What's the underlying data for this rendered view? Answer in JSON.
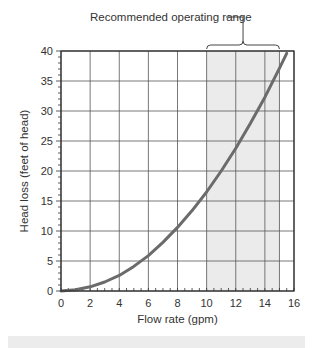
{
  "chart_data": {
    "type": "line",
    "title": "",
    "annotation": "Recommended operating range",
    "xlabel": "Flow rate (gpm)",
    "ylabel": "Head loss (feet of head)",
    "xlim": [
      0,
      16
    ],
    "ylim": [
      0,
      40
    ],
    "xticks": [
      0,
      2,
      4,
      6,
      8,
      10,
      12,
      14,
      16
    ],
    "yticks": [
      0,
      5,
      10,
      15,
      20,
      25,
      30,
      35,
      40
    ],
    "grid": true,
    "shaded_range": {
      "x_start": 10,
      "x_end": 15,
      "label": "Recommended operating range"
    },
    "series": [
      {
        "name": "Head loss",
        "x": [
          0,
          1,
          2,
          3,
          4,
          5,
          6,
          7,
          8,
          9,
          10,
          11,
          12,
          13,
          14,
          15,
          15.5
        ],
        "y": [
          0,
          0.2,
          0.7,
          1.5,
          2.6,
          4.1,
          5.9,
          8.1,
          10.6,
          13.4,
          16.5,
          20.0,
          23.8,
          27.9,
          32.3,
          37.1,
          39.6
        ]
      }
    ]
  },
  "colors": {
    "curve": "#6b6b6b",
    "grid": "#555555",
    "shade": "#ebebeb",
    "axis": "#333333"
  }
}
